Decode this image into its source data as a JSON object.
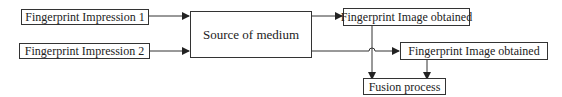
{
  "diagram": {
    "nodes": {
      "impression1": "Fingerprint Impression 1",
      "impression2": "Fingerprint Impression 2",
      "source": "Source of medium",
      "image1": "Fingerprint Image obtained",
      "image2": "Fingerprint Image obtained",
      "fusion": "Fusion process"
    },
    "edges": [
      {
        "from": "impression1",
        "to": "source"
      },
      {
        "from": "impression2",
        "to": "source"
      },
      {
        "from": "source",
        "to": "image1"
      },
      {
        "from": "source",
        "to": "image2"
      },
      {
        "from": "image1",
        "to": "fusion"
      },
      {
        "from": "image2",
        "to": "fusion"
      }
    ],
    "colors": {
      "line": "#333333",
      "background": "#ffffff",
      "text": "#222222"
    }
  }
}
